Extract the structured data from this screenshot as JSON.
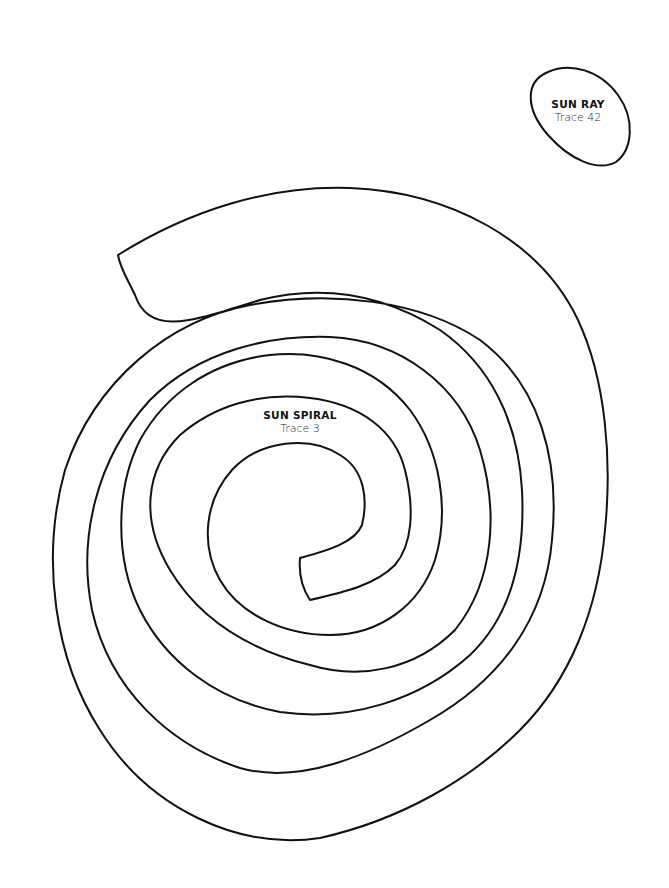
{
  "shapes": [
    {
      "id": "sun-ray",
      "title": "SUN RAY",
      "subtitle": "Trace 42"
    },
    {
      "id": "sun-spiral",
      "title": "SUN SPIRAL",
      "subtitle": "Trace 3"
    }
  ],
  "colors": {
    "stroke": "#111111",
    "background": "#ffffff"
  }
}
